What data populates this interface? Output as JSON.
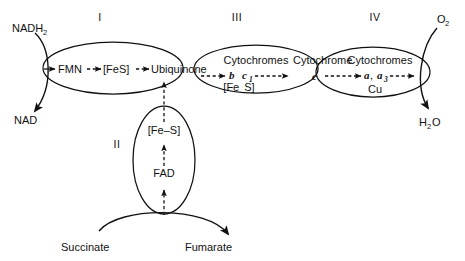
{
  "diagram": {
    "complexes": [
      {
        "numeral": "I",
        "components": [
          "FMN",
          "[FeS]",
          "Ubiquinone"
        ]
      },
      {
        "numeral": "II",
        "components": [
          "[Fe-S]",
          "FAD"
        ]
      },
      {
        "numeral": "III",
        "components": [
          "Cytochromes",
          "b",
          "c",
          "1",
          "[Fe  S]"
        ]
      },
      {
        "numeral": "IV",
        "components": [
          "Cytochromes",
          "a",
          "a",
          "3",
          "Cu"
        ]
      }
    ],
    "substrates": {
      "nadh": "NADH",
      "nadh_sub": "2",
      "nad": "NAD",
      "succinate": "Succinate",
      "fumarate": "Fumarate",
      "oxygen": "O",
      "oxygen_sub": "2",
      "water_h": "H",
      "water_sub": "2",
      "water_o": "O"
    },
    "carriers": {
      "cytochrome_c_label": "Cytochrome",
      "cytochrome_c_italic": "c"
    },
    "complex1": {
      "fmn": "FMN",
      "fes": "[FeS]",
      "ubiquinone": "Ubiquinone"
    },
    "complex2": {
      "fes_open": "[Fe",
      "fes_dash": "–",
      "fes_close": "S]",
      "fad": "FAD"
    },
    "complex3": {
      "cytochromes": "Cytochromes",
      "cyt_b": "b",
      "cyt_c1": "c",
      "cyt_c1_sub": "1",
      "fes_open": "[Fe",
      "fes_close": "S]"
    },
    "complex4": {
      "cytochromes": "Cytochromes",
      "cyt_a": "a",
      "comma": ",",
      "cyt_a3": "a",
      "cyt_a3_sub": "3",
      "cu": "Cu"
    },
    "colors": {
      "ink": "#111111",
      "background": "#ffffff"
    }
  }
}
